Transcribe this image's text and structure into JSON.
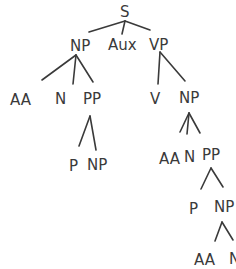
{
  "diagram": {
    "type": "syntax-tree",
    "style": "hand-drawn",
    "ink_color": "#3a3a3a",
    "background": "#ffffff",
    "nodes": {
      "s": "S",
      "np1": "NP",
      "aux": "Aux",
      "vp": "VP",
      "aa1": "AA",
      "n1": "N",
      "pp1": "PP",
      "p1": "P",
      "np2": "NP",
      "v": "V",
      "np3": "NP",
      "aa2": "AA",
      "n2": "N",
      "pp2": "PP",
      "p2": "P",
      "np4": "NP",
      "aa3": "AA",
      "n3": "N"
    },
    "edges": [
      [
        "S",
        "NP"
      ],
      [
        "S",
        "Aux"
      ],
      [
        "S",
        "VP"
      ],
      [
        "NP",
        "AA"
      ],
      [
        "NP",
        "N"
      ],
      [
        "NP",
        "PP"
      ],
      [
        "PP",
        "P"
      ],
      [
        "PP",
        "NP"
      ],
      [
        "VP",
        "V"
      ],
      [
        "VP",
        "NP"
      ],
      [
        "NP",
        "AA"
      ],
      [
        "NP",
        "N"
      ],
      [
        "NP",
        "PP"
      ],
      [
        "PP",
        "P"
      ],
      [
        "PP",
        "NP"
      ],
      [
        "NP",
        "AA"
      ],
      [
        "NP",
        "N"
      ]
    ]
  }
}
